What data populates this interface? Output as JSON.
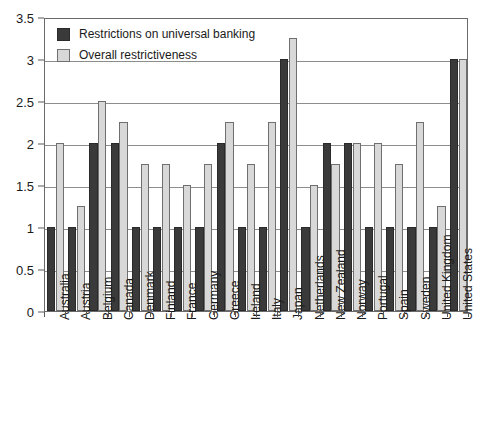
{
  "chart_data": {
    "type": "bar",
    "title": "",
    "xlabel": "",
    "ylabel": "",
    "ylim": [
      0,
      3.5
    ],
    "ytick_labels": [
      "0",
      "0.5",
      "1",
      "1.5",
      "2",
      "2.5",
      "3",
      "3.5"
    ],
    "ytick_values": [
      0,
      0.5,
      1,
      1.5,
      2,
      2.5,
      3,
      3.5
    ],
    "grid": true,
    "legend_position": "top-left",
    "categories": [
      "Australia",
      "Austria",
      "Belgium",
      "Canada",
      "Denmark",
      "Finland",
      "France",
      "Germany",
      "Greece",
      "Ireland",
      "Italy",
      "Japan",
      "Netherlands",
      "New Zealand",
      "Norway",
      "Portugal",
      "Spain",
      "Sweden",
      "United Kingdom",
      "United States"
    ],
    "series": [
      {
        "name": "Restrictions on universal banking",
        "color": "#3a3a3a",
        "values": [
          1,
          1,
          2,
          2,
          1,
          1,
          1,
          1,
          2,
          1,
          1,
          3,
          1,
          2,
          2,
          1,
          1,
          1,
          1,
          3
        ]
      },
      {
        "name": "Overall restrictiveness",
        "color": "#d8d8d8",
        "values": [
          2,
          1.25,
          2.5,
          2.25,
          1.75,
          1.75,
          1.5,
          1.75,
          2.25,
          1.75,
          2.25,
          3.25,
          1.5,
          1.75,
          2,
          2,
          1.75,
          2.25,
          1.25,
          3
        ]
      }
    ]
  },
  "legend": {
    "items": [
      {
        "label": "Restrictions on universal banking",
        "swatch": "dark"
      },
      {
        "label": "Overall restrictiveness",
        "swatch": "light"
      }
    ]
  }
}
